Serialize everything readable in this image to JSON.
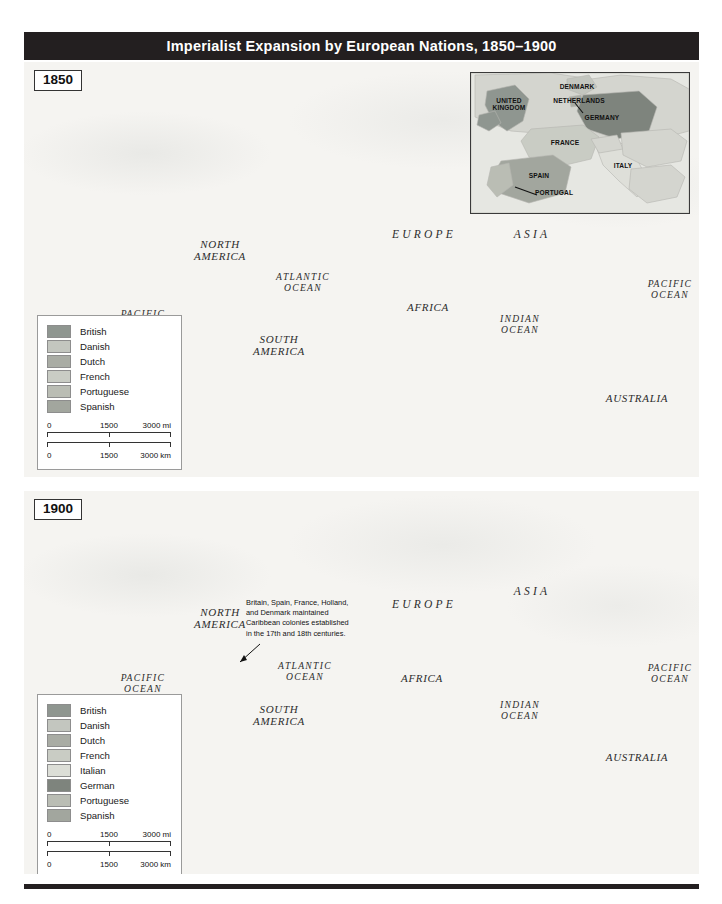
{
  "figure": {
    "title": "Imperialist Expansion by European Nations, 1850–1900",
    "width": 722,
    "height": 904
  },
  "colors": {
    "title_bar": "#231f20",
    "ocean": "#f5f4f1",
    "unclaimed_land": "#d9d8d2",
    "british": "#8f9690",
    "danish": "#c3c6bf",
    "dutch": "#a9aca4",
    "french": "#c9ccc4",
    "italian": "#dcded7",
    "german": "#7e847d",
    "portuguese": "#babdb4",
    "spanish": "#a2a69e"
  },
  "panels": [
    {
      "id": "1850",
      "year_label": "1850",
      "labels": [
        {
          "text": "NORTH\nAMERICA",
          "kind": "cont",
          "x": 196,
          "y": 188
        },
        {
          "text": "SOUTH\nAMERICA",
          "kind": "cont",
          "x": 255,
          "y": 283
        },
        {
          "text": "EUROPE",
          "kind": "contwide",
          "x": 400,
          "y": 172
        },
        {
          "text": "ASIA",
          "kind": "contwide",
          "x": 508,
          "y": 172
        },
        {
          "text": "AFRICA",
          "kind": "cont",
          "x": 404,
          "y": 245
        },
        {
          "text": "AUSTRALIA",
          "kind": "cont",
          "x": 613,
          "y": 336
        },
        {
          "text": "ATLANTIC\nOCEAN",
          "kind": "ocean-l",
          "x": 279,
          "y": 221
        },
        {
          "text": "PACIFIC\nOCEAN",
          "kind": "ocean-l",
          "x": 119,
          "y": 258
        },
        {
          "text": "PACIFIC\nOCEAN",
          "kind": "ocean-l",
          "x": 646,
          "y": 228
        },
        {
          "text": "INDIAN\nOCEAN",
          "kind": "ocean-l",
          "x": 496,
          "y": 263
        }
      ],
      "legend": {
        "entries": [
          {
            "name": "British",
            "color_key": "british"
          },
          {
            "name": "Danish",
            "color_key": "danish"
          },
          {
            "name": "Dutch",
            "color_key": "dutch"
          },
          {
            "name": "French",
            "color_key": "french"
          },
          {
            "name": "Portuguese",
            "color_key": "portuguese"
          },
          {
            "name": "Spanish",
            "color_key": "spanish"
          }
        ],
        "scale_miles": {
          "ticks": [
            "0",
            "1500",
            "3000 mi"
          ]
        },
        "scale_km": {
          "ticks": [
            "0",
            "1500",
            "3000 km"
          ]
        }
      },
      "inset": {
        "title": "Europe detail",
        "labels": [
          {
            "text": "UNITED\nKINGDOM",
            "x": 38,
            "y": 31
          },
          {
            "text": "DENMARK",
            "x": 106,
            "y": 14
          },
          {
            "text": "NETHERLANDS",
            "x": 108,
            "y": 28
          },
          {
            "text": "GERMANY",
            "x": 131,
            "y": 45
          },
          {
            "text": "FRANCE",
            "x": 94,
            "y": 70
          },
          {
            "text": "ITALY",
            "x": 152,
            "y": 93
          },
          {
            "text": "SPAIN",
            "x": 68,
            "y": 103
          },
          {
            "text": "PORTUGAL",
            "x": 83,
            "y": 120
          }
        ]
      }
    },
    {
      "id": "1900",
      "year_label": "1900",
      "labels": [
        {
          "text": "NORTH\nAMERICA",
          "kind": "cont",
          "x": 196,
          "y": 127
        },
        {
          "text": "SOUTH\nAMERICA",
          "kind": "cont",
          "x": 255,
          "y": 224
        },
        {
          "text": "EUROPE",
          "kind": "contwide",
          "x": 400,
          "y": 113
        },
        {
          "text": "ASIA",
          "kind": "contwide",
          "x": 508,
          "y": 100
        },
        {
          "text": "AFRICA",
          "kind": "cont",
          "x": 398,
          "y": 187
        },
        {
          "text": "AUSTRALIA",
          "kind": "cont",
          "x": 613,
          "y": 266
        },
        {
          "text": "ATLANTIC\nOCEAN",
          "kind": "ocean-l",
          "x": 281,
          "y": 181
        },
        {
          "text": "PACIFIC\nOCEAN",
          "kind": "ocean-l",
          "x": 119,
          "y": 193
        },
        {
          "text": "PACIFIC\nOCEAN",
          "kind": "ocean-l",
          "x": 646,
          "y": 183
        },
        {
          "text": "INDIAN\nOCEAN",
          "kind": "ocean-l",
          "x": 496,
          "y": 220
        }
      ],
      "annotation": {
        "text": "Britain, Spain, France, Holland, and Denmark maintained Caribbean colonies established in the 17th and 18th centuries.",
        "x": 222,
        "y": 107
      },
      "legend": {
        "entries": [
          {
            "name": "British",
            "color_key": "british"
          },
          {
            "name": "Danish",
            "color_key": "danish"
          },
          {
            "name": "Dutch",
            "color_key": "dutch"
          },
          {
            "name": "French",
            "color_key": "french"
          },
          {
            "name": "Italian",
            "color_key": "italian"
          },
          {
            "name": "German",
            "color_key": "german"
          },
          {
            "name": "Portuguese",
            "color_key": "portuguese"
          },
          {
            "name": "Spanish",
            "color_key": "spanish"
          }
        ],
        "scale_miles": {
          "ticks": [
            "0",
            "1500",
            "3000 mi"
          ]
        },
        "scale_km": {
          "ticks": [
            "0",
            "1500",
            "3000 km"
          ]
        }
      }
    }
  ]
}
